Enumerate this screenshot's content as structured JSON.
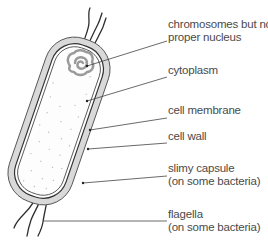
{
  "diagram": {
    "labels": [
      {
        "id": "chromosomes",
        "line1": "chromosomes but no",
        "line2": "proper nucleus"
      },
      {
        "id": "cytoplasm",
        "line1": "cytoplasm",
        "line2": ""
      },
      {
        "id": "cell-membrane",
        "line1": "cell membrane",
        "line2": ""
      },
      {
        "id": "cell-wall",
        "line1": "cell wall",
        "line2": ""
      },
      {
        "id": "slimy-capsule",
        "line1": "slimy capsule",
        "line2": "(on some bacteria)"
      },
      {
        "id": "flagella",
        "line1": "flagella",
        "line2": "(on some bacteria)"
      }
    ],
    "colors": {
      "capsule_fill": "#d9d9d9",
      "outline": "#3a3a3a",
      "chromosome": "#9a9a9a",
      "cytoplasm_dots": "#bdbdbd",
      "text": "#4a4a4a",
      "leader": "#444444"
    }
  }
}
